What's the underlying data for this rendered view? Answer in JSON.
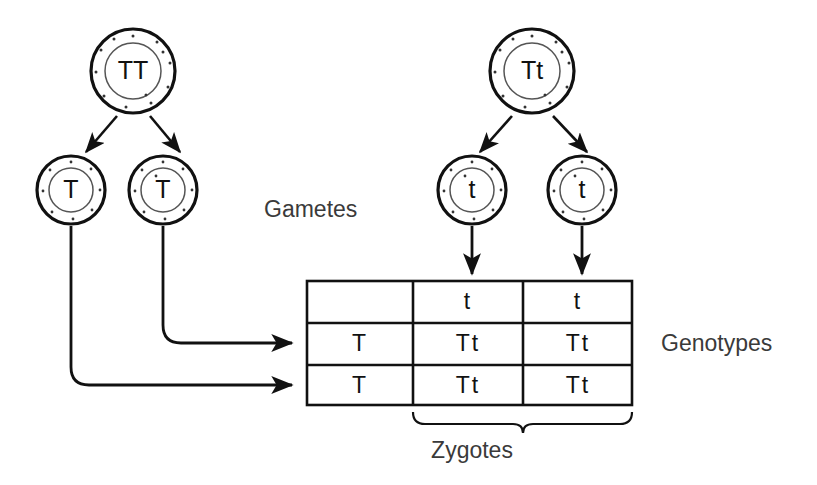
{
  "diagram": {
    "stroke_color": "#111111",
    "background_color": "#ffffff",
    "text_color": "#3a3a3a"
  },
  "parents": [
    {
      "id": "parent-left",
      "genotype": "TT",
      "cx": 133,
      "cy": 71
    },
    {
      "id": "parent-right",
      "genotype": "Tt",
      "cx": 532,
      "cy": 71
    }
  ],
  "gametes": [
    {
      "id": "gamete-left-1",
      "allele": "T",
      "cx": 71,
      "cy": 190
    },
    {
      "id": "gamete-left-2",
      "allele": "T",
      "cx": 163,
      "cy": 190
    },
    {
      "id": "gamete-right-1",
      "allele": "t",
      "cx": 472,
      "cy": 190
    },
    {
      "id": "gamete-right-2",
      "allele": "t",
      "cx": 582,
      "cy": 190
    }
  ],
  "punnett": {
    "corner": "",
    "column_headers": [
      "t",
      "t"
    ],
    "row_headers": [
      "T",
      "T"
    ],
    "cells": [
      [
        "Tt",
        "Tt"
      ],
      [
        "Tt",
        "Tt"
      ]
    ]
  },
  "labels": {
    "gametes": "Gametes",
    "genotypes": "Genotypes",
    "zygotes": "Zygotes"
  }
}
